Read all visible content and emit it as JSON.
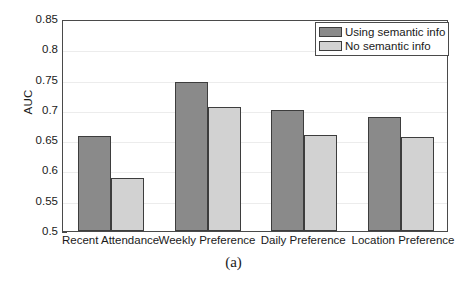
{
  "chart_data": {
    "type": "bar",
    "title": "",
    "subtitle": "",
    "xlabel": "",
    "ylabel": "AUC",
    "ylim": [
      0.5,
      0.85
    ],
    "ytick_labels": [
      "0.5",
      "0.55",
      "0.6",
      "0.65",
      "0.7",
      "0.75",
      "0.8",
      "0.85"
    ],
    "ytick_values": [
      0.5,
      0.55,
      0.6,
      0.65,
      0.7,
      0.75,
      0.8,
      0.85
    ],
    "grid": true,
    "grid_axis": "y",
    "legend_position": "top-right",
    "categories": [
      "Recent Attendance",
      "Weekly Preference",
      "Daily Preference",
      "Location Preference"
    ],
    "series": [
      {
        "name": "Using semantic info",
        "color": "#8a8a8a",
        "values": [
          0.657,
          0.746,
          0.7,
          0.688
        ]
      },
      {
        "name": "No semantic info",
        "color": "#d2d2d2",
        "values": [
          0.588,
          0.704,
          0.659,
          0.655
        ]
      }
    ]
  },
  "figure": {
    "caption": "(a)"
  },
  "colors": {
    "series_dark": "#8a8a8a",
    "series_light": "#d2d2d2",
    "axis": "#4a4a4a",
    "grid": "#ececec",
    "background": "#ffffff",
    "text": "#1a1a1a"
  }
}
